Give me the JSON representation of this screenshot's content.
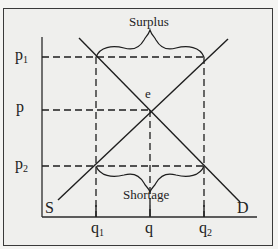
{
  "diagram": {
    "y_labels": {
      "p1": {
        "base": "p",
        "sub": "1"
      },
      "p": {
        "base": "p",
        "sub": ""
      },
      "p2": {
        "base": "p",
        "sub": "2"
      }
    },
    "x_labels": {
      "q1": {
        "base": "q",
        "sub": "1"
      },
      "q": {
        "base": "q",
        "sub": ""
      },
      "q2": {
        "base": "q",
        "sub": "2"
      }
    },
    "curve_labels": {
      "supply": "S",
      "demand": "D",
      "equilibrium": "e"
    },
    "annotations": {
      "surplus": "Surplus",
      "shortage": "Shortage"
    },
    "colors": {
      "line": "#1e1e1e",
      "background": "#efefed",
      "frame": "#3a3a3a"
    }
  }
}
